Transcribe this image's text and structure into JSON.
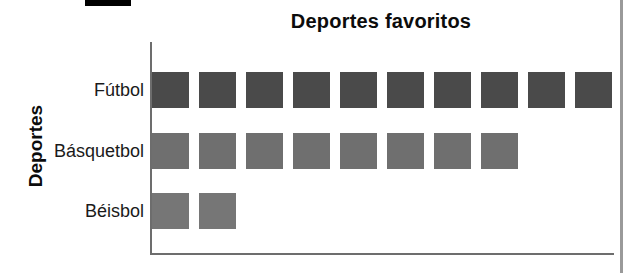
{
  "page": {
    "background_color": "#ffffff",
    "divider_color": "#9a9a9a",
    "top_mark_color": "#000000"
  },
  "chart_data": {
    "type": "bar",
    "subtype": "pictograph-squares",
    "title": "Deportes favoritos",
    "xlabel": "",
    "ylabel": "Deportes",
    "orientation": "horizontal",
    "grid": false,
    "legend": "none",
    "axis_line_color": "#6d6d6d",
    "categories": [
      "Fútbol",
      "Básquetbol",
      "Béisbol"
    ],
    "values": [
      10,
      8,
      2
    ],
    "xlim": [
      0,
      10
    ],
    "series": [
      {
        "name": "Deportes favoritos",
        "values": [
          10,
          8,
          2
        ]
      }
    ],
    "bars": [
      {
        "category": "Fútbol",
        "count": 10,
        "color": "#4a4a4a"
      },
      {
        "category": "Básquetbol",
        "count": 8,
        "color": "#6f6f6f"
      },
      {
        "category": "Béisbol",
        "count": 2,
        "color": "#767676"
      }
    ]
  },
  "axis": {
    "y_title": "Deportes",
    "categories": [
      {
        "label": "Fútbol"
      },
      {
        "label": "Básquetbol"
      },
      {
        "label": "Béisbol"
      }
    ]
  },
  "header": {
    "title": "Deportes favoritos"
  }
}
